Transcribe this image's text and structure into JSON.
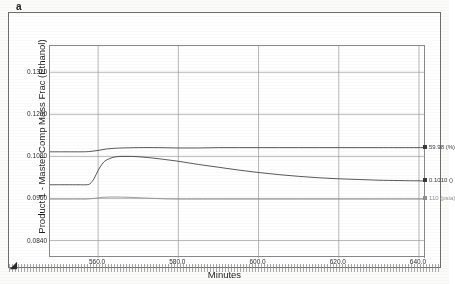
{
  "figure": {
    "panel_label": "a",
    "strip_marker_glyph": "◢"
  },
  "chart": {
    "xlabel": "Minutes",
    "ylabel": "Product 1 - Master Comp Mass Frac (Ethanol)",
    "y_ticks": [
      "0.1320",
      "0.1200",
      "0.1080",
      "0.0960",
      "0.0840"
    ],
    "x_ticks": [
      "560.0",
      "580.0",
      "600.0",
      "620.0",
      "640.0"
    ],
    "annotations": [
      {
        "text": "59.98 (%)",
        "color": "#333333"
      },
      {
        "text": "0.1010 ()",
        "color": "#333333"
      },
      {
        "text": "110 (psia)",
        "color": "#9a9a9a"
      }
    ]
  },
  "chart_data": {
    "type": "line",
    "title": "",
    "subtitle": "",
    "xlabel": "Minutes",
    "ylabel": "Product 1 - Master Comp Mass Frac (Ethanol)",
    "xlim": [
      548.0,
      641.5
    ],
    "ylim": [
      0.079,
      0.1395
    ],
    "grid": true,
    "legend_position": "right-edge-annotations",
    "x_tick_values": [
      560.0,
      580.0,
      600.0,
      620.0,
      640.0
    ],
    "y_tick_values": [
      0.132,
      0.12,
      0.108,
      0.096,
      0.084
    ],
    "series": [
      {
        "name": "59.98 (%)",
        "color": "#3a3a3a",
        "end_label": "59.98 (%)",
        "x": [
          548,
          552,
          556,
          558,
          560,
          562,
          564,
          566,
          570,
          575,
          580,
          585,
          590,
          595,
          600,
          605,
          610,
          615,
          620,
          625,
          630,
          635,
          641.5
        ],
        "y": [
          0.1093,
          0.1093,
          0.1093,
          0.1094,
          0.1097,
          0.1101,
          0.1103,
          0.1104,
          0.1105,
          0.1105,
          0.1104,
          0.1104,
          0.1105,
          0.1105,
          0.1105,
          0.1105,
          0.1105,
          0.1105,
          0.1105,
          0.1105,
          0.1105,
          0.1105,
          0.1105
        ]
      },
      {
        "name": "0.1010 ()",
        "color": "#3a3a3a",
        "end_label": "0.1010 ()",
        "x": [
          548,
          552,
          555,
          557,
          558,
          559,
          560,
          561,
          562,
          564,
          566,
          568,
          570,
          573,
          576,
          580,
          585,
          590,
          595,
          600,
          605,
          610,
          615,
          620,
          625,
          630,
          635,
          641.5
        ],
        "y": [
          0.0999,
          0.0999,
          0.0999,
          0.0999,
          0.1002,
          0.1017,
          0.104,
          0.1058,
          0.1069,
          0.1078,
          0.108,
          0.108,
          0.1079,
          0.1076,
          0.1072,
          0.1066,
          0.1057,
          0.1049,
          0.1041,
          0.1034,
          0.1028,
          0.1023,
          0.1019,
          0.1016,
          0.1014,
          0.1012,
          0.1011,
          0.101
        ]
      },
      {
        "name": "110 (psia)",
        "color": "#8f8f8f",
        "end_label": "110 (psia)",
        "x": [
          548,
          552,
          555,
          557,
          559,
          561,
          563,
          565,
          568,
          572,
          576,
          580,
          590,
          600,
          610,
          620,
          630,
          641.5
        ],
        "y": [
          0.0958,
          0.0958,
          0.0958,
          0.0958,
          0.096,
          0.0963,
          0.0964,
          0.0964,
          0.0963,
          0.0961,
          0.0959,
          0.0958,
          0.0958,
          0.0958,
          0.0958,
          0.0958,
          0.0958,
          0.0958
        ]
      }
    ]
  }
}
